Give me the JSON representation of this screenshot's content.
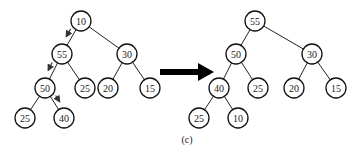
{
  "caption": "(c)",
  "transition_arrow": "right-arrow",
  "before_tree": {
    "label": "before-sift-down",
    "nodes": [
      {
        "id": "a0",
        "value": "10"
      },
      {
        "id": "a1",
        "value": "55"
      },
      {
        "id": "a2",
        "value": "30"
      },
      {
        "id": "a3",
        "value": "50"
      },
      {
        "id": "a4",
        "value": "25"
      },
      {
        "id": "a5",
        "value": "20"
      },
      {
        "id": "a6",
        "value": "15"
      },
      {
        "id": "a7",
        "value": "25"
      },
      {
        "id": "a8",
        "value": "40"
      }
    ],
    "edges": [
      [
        "a0",
        "a1"
      ],
      [
        "a0",
        "a2"
      ],
      [
        "a1",
        "a3"
      ],
      [
        "a1",
        "a4"
      ],
      [
        "a2",
        "a5"
      ],
      [
        "a2",
        "a6"
      ],
      [
        "a3",
        "a7"
      ],
      [
        "a3",
        "a8"
      ]
    ],
    "sift_path": [
      [
        "a0",
        "a1"
      ],
      [
        "a1",
        "a3"
      ],
      [
        "a3",
        "a8"
      ]
    ]
  },
  "after_tree": {
    "label": "after-sift-down",
    "nodes": [
      {
        "id": "b0",
        "value": "55"
      },
      {
        "id": "b1",
        "value": "50"
      },
      {
        "id": "b2",
        "value": "30"
      },
      {
        "id": "b3",
        "value": "40"
      },
      {
        "id": "b4",
        "value": "25"
      },
      {
        "id": "b5",
        "value": "20"
      },
      {
        "id": "b6",
        "value": "15"
      },
      {
        "id": "b7",
        "value": "25"
      },
      {
        "id": "b8",
        "value": "10"
      }
    ],
    "edges": [
      [
        "b0",
        "b1"
      ],
      [
        "b0",
        "b2"
      ],
      [
        "b1",
        "b3"
      ],
      [
        "b1",
        "b4"
      ],
      [
        "b2",
        "b5"
      ],
      [
        "b2",
        "b6"
      ],
      [
        "b3",
        "b7"
      ],
      [
        "b3",
        "b8"
      ]
    ]
  }
}
